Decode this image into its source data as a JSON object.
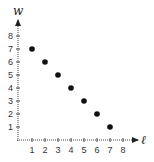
{
  "chart_data": {
    "type": "scatter",
    "title": "",
    "xlabel": "ℓ",
    "ylabel": "w",
    "x": [
      1,
      2,
      3,
      4,
      5,
      6,
      7
    ],
    "y": [
      7,
      6,
      5,
      4,
      3,
      2,
      1
    ],
    "xlim": [
      0,
      8
    ],
    "ylim": [
      0,
      8
    ],
    "x_ticks": [
      "1",
      "2",
      "3",
      "4",
      "5",
      "6",
      "7",
      "8"
    ],
    "y_ticks": [
      "1",
      "2",
      "3",
      "4",
      "5",
      "6",
      "7",
      "8"
    ],
    "grid": false,
    "legend": null,
    "point_color": "#111111",
    "axis_style": "dotted with arrowheads"
  }
}
